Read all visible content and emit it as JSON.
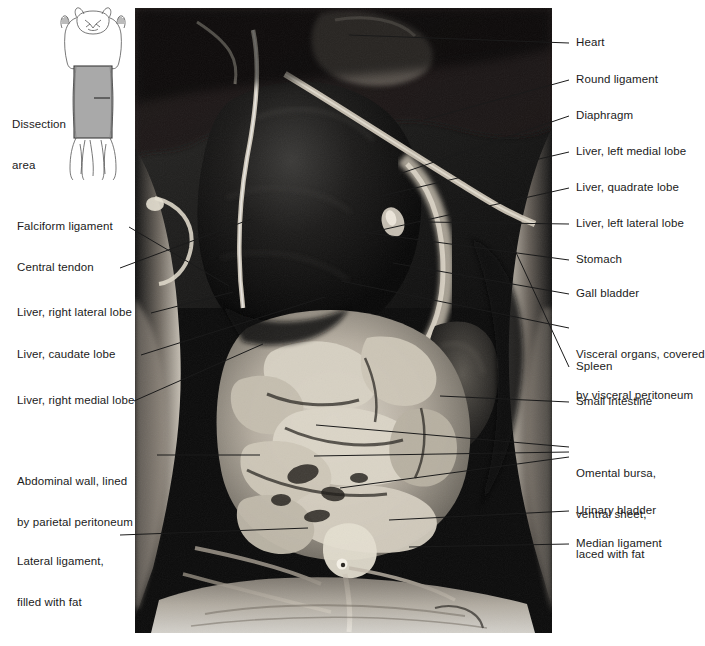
{
  "figure": {
    "type": "anatomical-dissection-photograph",
    "photo": {
      "description": "Black-and-white photograph of an opened ventral body wall showing liver lobes, stomach, spleen, small intestine, omental bursa and urinary bladder",
      "frame": {
        "x": 135,
        "y": 8,
        "width": 417,
        "height": 625
      }
    }
  },
  "inset": {
    "label_line1": "Dissection",
    "label_line2": "area",
    "label_text": "Dissection area",
    "shading_color": "#a9a9a9",
    "outline_color": "#4a4a4a",
    "orientation": "ventral view, head at top",
    "icon_name": "cat-ventral-outline"
  },
  "labels_left": [
    {
      "id": "falciform-ligament",
      "lines": [
        "Falciform ligament"
      ]
    },
    {
      "id": "central-tendon",
      "lines": [
        "Central tendon"
      ]
    },
    {
      "id": "liver-right-lateral",
      "lines": [
        "Liver, right lateral lobe"
      ]
    },
    {
      "id": "liver-caudate",
      "lines": [
        "Liver, caudate lobe"
      ]
    },
    {
      "id": "liver-right-medial",
      "lines": [
        "Liver, right medial lobe"
      ]
    },
    {
      "id": "abdominal-wall",
      "lines": [
        "Abdominal wall, lined",
        "by parietal peritoneum"
      ]
    },
    {
      "id": "lateral-ligament",
      "lines": [
        "Lateral ligament,",
        "filled with fat"
      ]
    }
  ],
  "labels_right": [
    {
      "id": "heart",
      "lines": [
        "Heart"
      ]
    },
    {
      "id": "round-ligament",
      "lines": [
        "Round ligament"
      ]
    },
    {
      "id": "diaphragm",
      "lines": [
        "Diaphragm"
      ]
    },
    {
      "id": "liver-left-medial",
      "lines": [
        "Liver, left medial lobe"
      ]
    },
    {
      "id": "liver-quadrate",
      "lines": [
        "Liver, quadrate lobe"
      ]
    },
    {
      "id": "liver-left-lateral",
      "lines": [
        "Liver, left lateral lobe"
      ]
    },
    {
      "id": "stomach",
      "lines": [
        "Stomach"
      ]
    },
    {
      "id": "gall-bladder",
      "lines": [
        "Gall bladder"
      ]
    },
    {
      "id": "visceral-organs",
      "lines": [
        "Visceral organs, covered",
        "by visceral peritoneum"
      ]
    },
    {
      "id": "spleen",
      "lines": [
        "Spleen"
      ]
    },
    {
      "id": "small-intestine",
      "lines": [
        "Small intestine"
      ]
    },
    {
      "id": "omental-bursa",
      "lines": [
        "Omental bursa,",
        "ventral sheet,",
        "laced with fat"
      ]
    },
    {
      "id": "urinary-bladder",
      "lines": [
        "Urinary bladder"
      ]
    },
    {
      "id": "median-ligament",
      "lines": [
        "Median ligament"
      ]
    }
  ],
  "colors": {
    "background": "#ffffff",
    "text": "#1b1b1b",
    "leader_line": "#1b1b1b",
    "photo_dark": "#0a0a0a",
    "photo_mid": "#8e8e8e",
    "photo_light": "#e8e4dc",
    "inset_fill": "#a9a9a9"
  }
}
